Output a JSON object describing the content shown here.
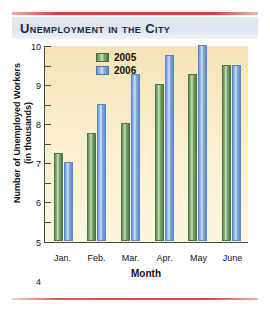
{
  "title": "Unemployment in the City",
  "rules": {
    "accent_color": "#d9413a"
  },
  "chart_data": {
    "type": "bar",
    "title": "Unemployment in the City",
    "xlabel": "Month",
    "ylabel": "Number of Unemployed Workers (in thousands)",
    "ylabel_line1": "Number of Unemployed Workers",
    "ylabel_line2": "(in thousands)",
    "categories": [
      "Jan.",
      "Feb.",
      "Mar.",
      "Apr.",
      "May",
      "June"
    ],
    "series": [
      {
        "name": "2005",
        "color": "#6a9d63",
        "values": [
          4.5,
          5.5,
          6.0,
          8.0,
          8.5,
          9.0
        ]
      },
      {
        "name": "2006",
        "color": "#7aa8dd",
        "values": [
          4.0,
          7.0,
          8.5,
          9.5,
          10.0,
          9.0
        ]
      }
    ],
    "ylim": [
      0,
      10
    ],
    "yticks": [
      0,
      1,
      2,
      3,
      4,
      5,
      6,
      7,
      8,
      9,
      10
    ],
    "ytick_labels": [
      "0",
      "1",
      "2",
      "3",
      "4",
      "5",
      "6",
      "7",
      "8",
      "9",
      "10"
    ],
    "grid": false,
    "legend_position": "top-left-inside",
    "plot_background": "#faeecb"
  }
}
